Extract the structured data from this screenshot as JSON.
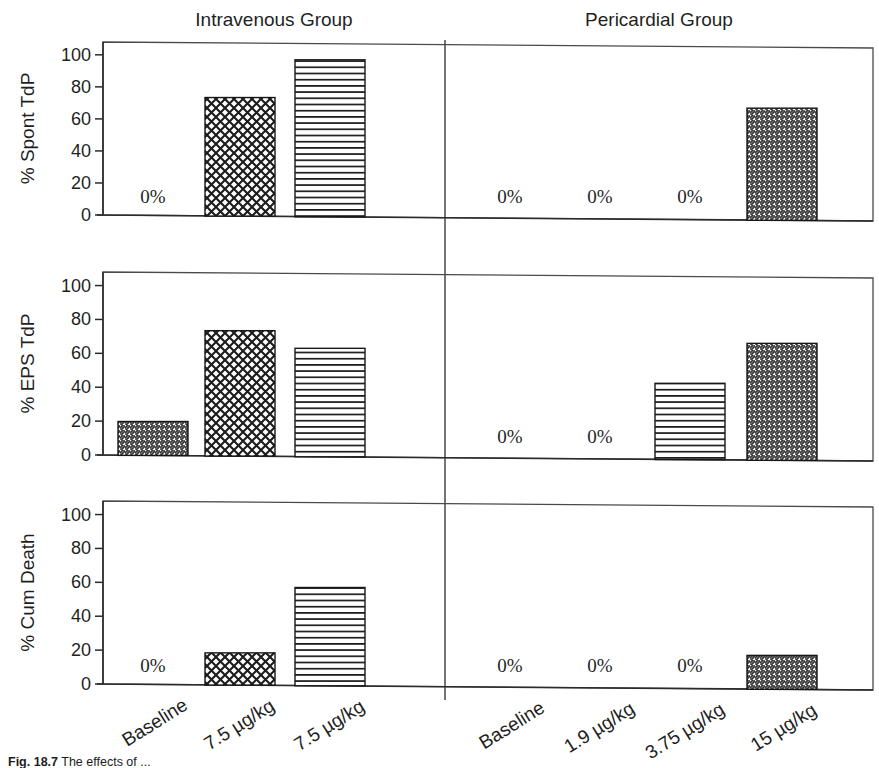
{
  "figure": {
    "caption_label": "Fig. 18.7",
    "caption_text": "The effects of ...",
    "group_titles": [
      "Intravenous Group",
      "Pericardial Group"
    ],
    "zero_marker": "0%"
  },
  "chart_data": {
    "type": "bar",
    "title": "",
    "xlabel": "",
    "ylim": [
      0,
      100
    ],
    "yticks": [
      0,
      20,
      40,
      60,
      80,
      100
    ],
    "ytick_labels": [
      "0",
      "20",
      "40",
      "60",
      "80",
      "100"
    ],
    "grid": false,
    "legend": "none",
    "panels": [
      {
        "ylabel": "% Spont TdP",
        "groups": [
          {
            "name": "Intravenous Group",
            "categories": [
              "Baseline",
              "7.5 µg/kg",
              "7.5 µg/kg"
            ],
            "values": [
              0,
              74,
              98
            ],
            "patterns": [
              "none",
              "crosshatch",
              "horizontal"
            ]
          },
          {
            "name": "Pericardial Group",
            "categories": [
              "Baseline",
              "1.9 µg/kg",
              "3.75 µg/kg",
              "15 µg/kg"
            ],
            "values": [
              0,
              0,
              0,
              70
            ],
            "patterns": [
              "none",
              "none",
              "none",
              "diagonal"
            ]
          }
        ]
      },
      {
        "ylabel": "% EPS TdP",
        "groups": [
          {
            "name": "Intravenous Group",
            "categories": [
              "Baseline",
              "7.5 µg/kg",
              "7.5 µg/kg"
            ],
            "values": [
              20,
              74,
              64
            ],
            "patterns": [
              "diagonal",
              "crosshatch",
              "horizontal"
            ]
          },
          {
            "name": "Pericardial Group",
            "categories": [
              "Baseline",
              "1.9 µg/kg",
              "3.75 µg/kg",
              "15 µg/kg"
            ],
            "values": [
              0,
              0,
              45,
              69
            ],
            "patterns": [
              "none",
              "none",
              "horizontal",
              "diagonal"
            ]
          }
        ]
      },
      {
        "ylabel": "% Cum Death",
        "groups": [
          {
            "name": "Intravenous Group",
            "categories": [
              "Baseline",
              "7.5 µg/kg",
              "7.5 µg/kg"
            ],
            "values": [
              0,
              19,
              58
            ],
            "patterns": [
              "none",
              "crosshatch",
              "horizontal"
            ]
          },
          {
            "name": "Pericardial Group",
            "categories": [
              "Baseline",
              "1.9 µg/kg",
              "3.75 µg/kg",
              "15 µg/kg"
            ],
            "values": [
              0,
              0,
              0,
              20
            ],
            "patterns": [
              "none",
              "none",
              "none",
              "diagonal"
            ]
          }
        ]
      }
    ]
  }
}
